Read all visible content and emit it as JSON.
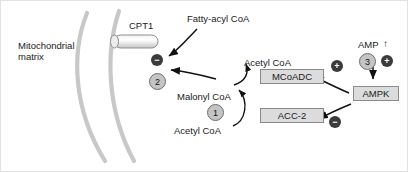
{
  "figure": {
    "background_color": "#ffffff",
    "membrane_color": "#c8c8c8",
    "box_fill_color": "#dcdcdc",
    "box_border_color": "#8a8a8a",
    "number_circle_color": "#c4c4c4",
    "sign_circle_color": "#3b3b3b",
    "arrow_color": "#111111"
  },
  "labels": {
    "mitochondrial_matrix": "Mitochondrial\nmatrix",
    "cpt1": "CPT1",
    "fatty_acyl_coa": "Fatty-acyl CoA",
    "malonyl_coa": "Malonyl CoA",
    "acetyl_coa_upper": "Acetyl CoA",
    "acetyl_coa_lower": "Acetyl CoA",
    "amp": "AMP",
    "amp_arrow": "↑"
  },
  "boxes": [
    {
      "id": "mcoadc",
      "label": "MCoADC"
    },
    {
      "id": "acc2",
      "label": "ACC-2"
    },
    {
      "id": "ampk",
      "label": "AMPK"
    }
  ],
  "step_markers": [
    {
      "id": "step-1",
      "label": "1"
    },
    {
      "id": "step-2",
      "label": "2"
    },
    {
      "id": "step-3",
      "label": "3"
    }
  ],
  "sign_markers": [
    {
      "id": "cpt1-inhibition",
      "label": "−",
      "meaning": "minus"
    },
    {
      "id": "malonyl-inhibition",
      "label": "−",
      "meaning": "minus"
    },
    {
      "id": "mcoadc-activation",
      "label": "+",
      "meaning": "plus"
    },
    {
      "id": "acc2-inhibition",
      "label": "−",
      "meaning": "minus"
    },
    {
      "id": "amp-activation",
      "label": "+",
      "meaning": "plus"
    }
  ]
}
